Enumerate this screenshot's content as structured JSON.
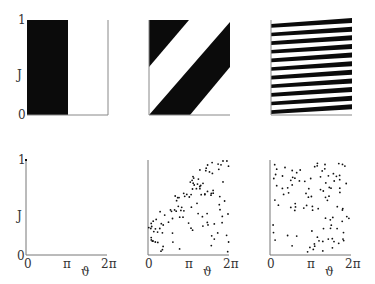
{
  "figure": {
    "top_row": [
      {
        "id": "a",
        "pattern": "vertical-half",
        "y_tick_top": "1",
        "y_label": "J",
        "y_tick_bottom": "0"
      },
      {
        "id": "b",
        "pattern": "diagonal-stripes"
      },
      {
        "id": "c",
        "pattern": "many-tilted-stripes",
        "stripe_count": 11
      }
    ],
    "bottom_row": [
      {
        "id": "d",
        "y_tick_top": "1",
        "y_label": "J",
        "y_tick_bottom": "0",
        "x_ticks": [
          "0",
          "π",
          "2π"
        ],
        "x_label": "ϑ"
      },
      {
        "id": "e",
        "x_ticks": [
          "0",
          "π",
          "2π"
        ],
        "x_label": "ϑ"
      },
      {
        "id": "f",
        "x_ticks": [
          "0",
          "π",
          "2π"
        ],
        "x_label": "ϑ"
      }
    ]
  },
  "labels": {
    "one": "1",
    "zero": "0",
    "J": "J",
    "pi": "π",
    "twopi": "2π",
    "theta": "ϑ"
  },
  "colors": {
    "ink": "#111111",
    "axis": "#777777",
    "paper": "#ffffff"
  }
}
